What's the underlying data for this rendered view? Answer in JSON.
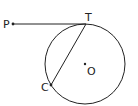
{
  "diagram": {
    "points": {
      "P": {
        "label": "P",
        "x": 13,
        "y": 24
      },
      "T": {
        "label": "T",
        "x": 86,
        "y": 24
      },
      "C": {
        "label": "C",
        "x": 51,
        "y": 85
      },
      "O": {
        "label": "O",
        "x": 85,
        "y": 64
      }
    },
    "circle": {
      "cx": 85,
      "cy": 64,
      "r": 40
    },
    "segments": [
      {
        "from": "P",
        "to": "T",
        "kind": "tangent"
      },
      {
        "from": "T",
        "to": "C",
        "kind": "chord"
      }
    ],
    "stroke_color": "#222222"
  }
}
